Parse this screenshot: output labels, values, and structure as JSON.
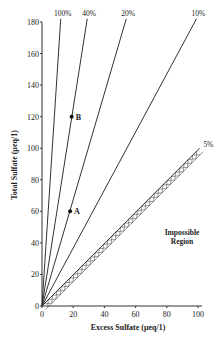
{
  "chart_data": {
    "type": "line",
    "title": "",
    "xlabel": "Excess Sulfate (μeq/1)",
    "ylabel": "Total Sulfate (μeq/1)",
    "xlim": [
      0,
      100
    ],
    "ylim": [
      0,
      180
    ],
    "x_ticks": [
      "0",
      "20",
      "40",
      "60",
      "80",
      "100"
    ],
    "y_ticks": [
      "0",
      "20",
      "40",
      "60",
      "80",
      "100",
      "120",
      "140",
      "160",
      "180"
    ],
    "grid": false,
    "series": [
      {
        "name": "100%",
        "x": [
          0,
          12
        ],
        "y": [
          0,
          182
        ]
      },
      {
        "name": "40%",
        "x": [
          0,
          29
        ],
        "y": [
          0,
          182
        ]
      },
      {
        "name": "20%",
        "x": [
          0,
          54
        ],
        "y": [
          0,
          182
        ]
      },
      {
        "name": "10%",
        "x": [
          0,
          99
        ],
        "y": [
          0,
          182
        ]
      },
      {
        "name": "5%",
        "x": [
          0,
          101
        ],
        "y": [
          0,
          100
        ]
      }
    ],
    "points": [
      {
        "label": "A",
        "x": 18,
        "y": 60
      },
      {
        "label": "B",
        "x": 19,
        "y": 120
      }
    ],
    "annotations": [
      "Impossible Region"
    ]
  },
  "labels": {
    "xlabel": "Excess Sulfate (μeq/1)",
    "ylabel": "Total Sulfate (μeq/1)",
    "region": [
      "Impossible",
      "Region"
    ],
    "lines": [
      "100%",
      "40%",
      "20%",
      "10%",
      "5%"
    ],
    "points": [
      "A",
      "B"
    ]
  }
}
